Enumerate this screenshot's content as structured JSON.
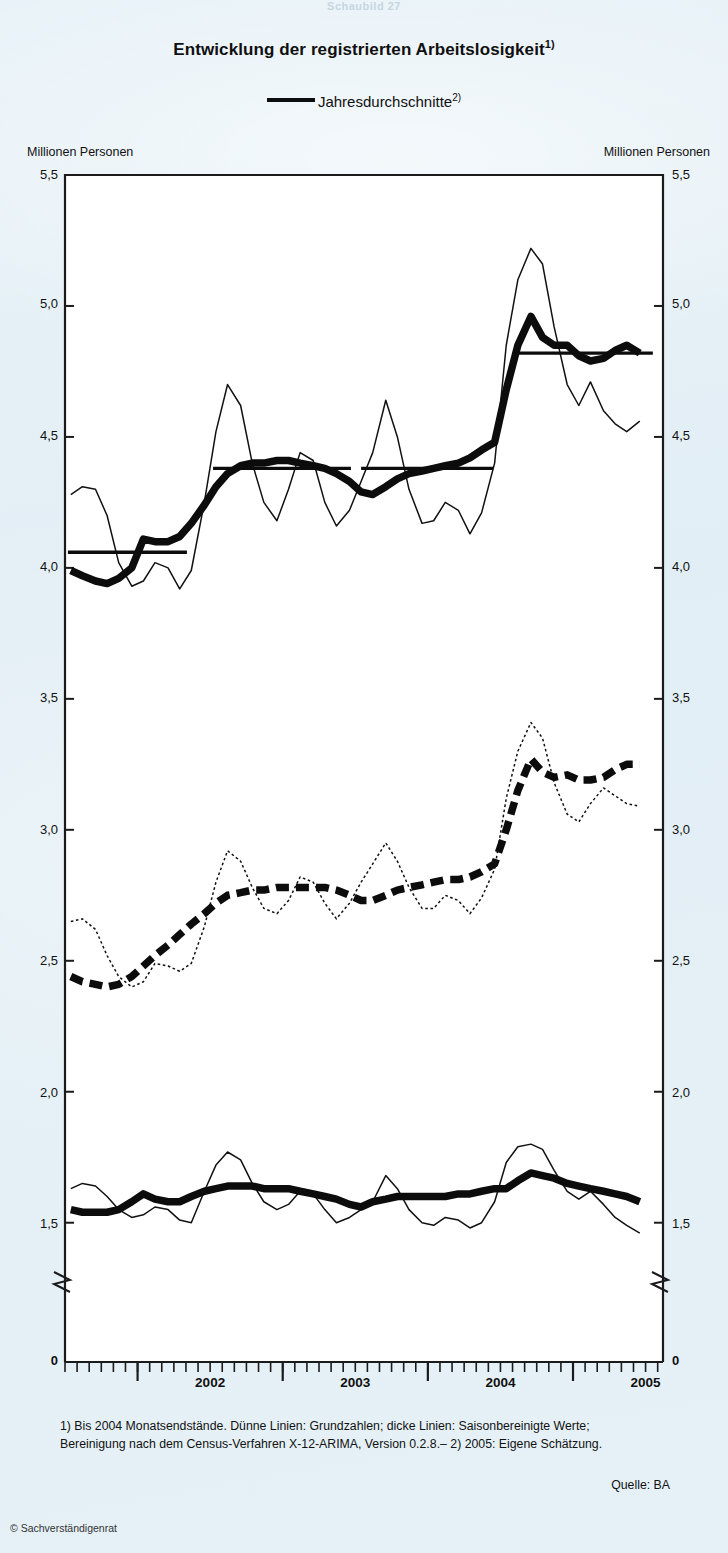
{
  "page": {
    "top_cut_text": "Schaubild 27",
    "copyright": "© Sachverständigenrat",
    "background_hex": "#e6f1f7",
    "ink_hex": "#101010"
  },
  "header": {
    "title": "Entwicklung der registrierten Arbeitslosigkeit",
    "title_footnote_marker": "1)",
    "legend_label": "Jahresdurchschnitte",
    "legend_footnote_marker": "2)"
  },
  "axes": {
    "unit_left": "Millionen Personen",
    "unit_right": "Millionen Personen",
    "y_ticks": [
      "5,5",
      "5,0",
      "4,5",
      "4,0",
      "3,5",
      "3,0",
      "2,5",
      "2,0",
      "1,5",
      "0"
    ],
    "y_zero_label": "0",
    "x_ticks": [
      "2002",
      "2003",
      "2004",
      "2005"
    ],
    "axis_break": true
  },
  "series_labels": {
    "germany": "Deutschland",
    "west": "Früheres Bundesgebiet ohne Berlin",
    "east": "Neue Bundesländer und Berlin"
  },
  "footer": {
    "footnote_line1": "1) Bis 2004 Monatsendstände. Dünne Linien: Grundzahlen; dicke Linien: Saisonbereinigte Werte;",
    "footnote_line2": "Bereinigung nach dem Census-Verfahren X-12-ARIMA, Version 0.2.8.– 2) 2005: Eigene Schätzung.",
    "source": "Quelle: BA"
  },
  "chart_data": {
    "type": "line",
    "title": "Entwicklung der registrierten Arbeitslosigkeit",
    "xlabel": "",
    "ylabel": "Millionen Personen",
    "ylim": [
      1.35,
      5.5
    ],
    "y_axis_break_below": 1.35,
    "xlim": [
      2001.5,
      2005.62
    ],
    "grid": false,
    "legend_position": "top-center",
    "x_tick_values": [
      2002,
      2003,
      2004,
      2005
    ],
    "x_minor_tick_interval_months": 1,
    "series": [
      {
        "name": "Deutschland – Grundzahlen (dünne Linie)",
        "style": "thin-solid",
        "x": [
          2001.54,
          2001.62,
          2001.71,
          2001.79,
          2001.87,
          2001.96,
          2002.04,
          2002.12,
          2002.21,
          2002.29,
          2002.37,
          2002.46,
          2002.54,
          2002.62,
          2002.71,
          2002.79,
          2002.87,
          2002.96,
          2003.04,
          2003.12,
          2003.21,
          2003.29,
          2003.37,
          2003.46,
          2003.54,
          2003.62,
          2003.71,
          2003.79,
          2003.87,
          2003.96,
          2004.04,
          2004.12,
          2004.21,
          2004.29,
          2004.37,
          2004.46,
          2004.54,
          2004.62,
          2004.71,
          2004.79,
          2004.87,
          2004.96,
          2005.04,
          2005.12,
          2005.21,
          2005.29,
          2005.37,
          2005.46
        ],
        "y": [
          4.28,
          4.31,
          4.3,
          4.2,
          4.02,
          3.93,
          3.95,
          4.02,
          4.0,
          3.92,
          3.99,
          4.25,
          4.52,
          4.7,
          4.62,
          4.4,
          4.25,
          4.18,
          4.3,
          4.44,
          4.41,
          4.25,
          4.16,
          4.22,
          4.33,
          4.44,
          4.64,
          4.5,
          4.3,
          4.17,
          4.18,
          4.25,
          4.22,
          4.13,
          4.21,
          4.4,
          4.85,
          5.1,
          5.22,
          5.16,
          4.92,
          4.7,
          4.62,
          4.71,
          4.6,
          4.55,
          4.52,
          4.56
        ]
      },
      {
        "name": "Deutschland – saisonbereinigt (dicke Linie)",
        "style": "thick-solid",
        "x": [
          2001.54,
          2001.62,
          2001.71,
          2001.79,
          2001.87,
          2001.96,
          2002.04,
          2002.12,
          2002.21,
          2002.29,
          2002.37,
          2002.46,
          2002.54,
          2002.62,
          2002.71,
          2002.79,
          2002.87,
          2002.96,
          2003.04,
          2003.12,
          2003.21,
          2003.29,
          2003.37,
          2003.46,
          2003.54,
          2003.62,
          2003.71,
          2003.79,
          2003.87,
          2003.96,
          2004.04,
          2004.12,
          2004.21,
          2004.29,
          2004.37,
          2004.46,
          2004.54,
          2004.62,
          2004.71,
          2004.79,
          2004.87,
          2004.96,
          2005.04,
          2005.12,
          2005.21,
          2005.29,
          2005.37,
          2005.46
        ],
        "y": [
          3.99,
          3.97,
          3.95,
          3.94,
          3.96,
          4.0,
          4.11,
          4.1,
          4.1,
          4.12,
          4.17,
          4.24,
          4.31,
          4.36,
          4.39,
          4.4,
          4.4,
          4.41,
          4.41,
          4.4,
          4.39,
          4.38,
          4.36,
          4.33,
          4.29,
          4.28,
          4.31,
          4.34,
          4.36,
          4.37,
          4.38,
          4.39,
          4.4,
          4.42,
          4.45,
          4.48,
          4.68,
          4.85,
          4.96,
          4.88,
          4.85,
          4.85,
          4.81,
          4.79,
          4.8,
          4.83,
          4.85,
          4.82
        ]
      },
      {
        "name": "Deutschland – Jahresdurchschnitte",
        "style": "annual-average",
        "segments": [
          {
            "x0": 2001.52,
            "x1": 2002.34,
            "y": 4.06
          },
          {
            "x0": 2002.52,
            "x1": 2003.47,
            "y": 4.38
          },
          {
            "x0": 2003.54,
            "x1": 2004.45,
            "y": 4.38
          },
          {
            "x0": 2004.6,
            "x1": 2005.55,
            "y": 4.82
          }
        ]
      },
      {
        "name": "Früheres Bundesgebiet ohne Berlin – Grundzahlen (dünne Linie)",
        "style": "dotted-thin",
        "x": [
          2001.54,
          2001.62,
          2001.71,
          2001.79,
          2001.87,
          2001.96,
          2002.04,
          2002.12,
          2002.21,
          2002.29,
          2002.37,
          2002.46,
          2002.54,
          2002.62,
          2002.71,
          2002.79,
          2002.87,
          2002.96,
          2003.04,
          2003.12,
          2003.21,
          2003.29,
          2003.37,
          2003.46,
          2003.54,
          2003.62,
          2003.71,
          2003.79,
          2003.87,
          2003.96,
          2004.04,
          2004.12,
          2004.21,
          2004.29,
          2004.37,
          2004.46,
          2004.54,
          2004.62,
          2004.71,
          2004.79,
          2004.87,
          2004.96,
          2005.04,
          2005.12,
          2005.21,
          2005.29,
          2005.37,
          2005.46
        ],
        "y": [
          2.65,
          2.66,
          2.62,
          2.52,
          2.44,
          2.4,
          2.42,
          2.49,
          2.48,
          2.46,
          2.49,
          2.63,
          2.8,
          2.92,
          2.88,
          2.78,
          2.7,
          2.68,
          2.73,
          2.82,
          2.8,
          2.72,
          2.66,
          2.72,
          2.8,
          2.87,
          2.95,
          2.88,
          2.78,
          2.7,
          2.7,
          2.75,
          2.73,
          2.68,
          2.74,
          2.85,
          3.12,
          3.3,
          3.41,
          3.35,
          3.18,
          3.06,
          3.03,
          3.1,
          3.16,
          3.13,
          3.1,
          3.09
        ]
      },
      {
        "name": "Früheres Bundesgebiet ohne Berlin – saisonbereinigt (dicke gestrichelte Linie)",
        "style": "thick-dashed",
        "x": [
          2001.54,
          2001.62,
          2001.71,
          2001.79,
          2001.87,
          2001.96,
          2002.04,
          2002.12,
          2002.21,
          2002.29,
          2002.37,
          2002.46,
          2002.54,
          2002.62,
          2002.71,
          2002.79,
          2002.87,
          2002.96,
          2003.04,
          2003.12,
          2003.21,
          2003.29,
          2003.37,
          2003.46,
          2003.54,
          2003.62,
          2003.71,
          2003.79,
          2003.87,
          2003.96,
          2004.04,
          2004.12,
          2004.21,
          2004.29,
          2004.37,
          2004.46,
          2004.54,
          2004.62,
          2004.71,
          2004.79,
          2004.87,
          2004.96,
          2005.04,
          2005.12,
          2005.21,
          2005.29,
          2005.37,
          2005.46
        ],
        "y": [
          2.44,
          2.42,
          2.41,
          2.4,
          2.41,
          2.44,
          2.48,
          2.52,
          2.56,
          2.6,
          2.64,
          2.68,
          2.72,
          2.75,
          2.76,
          2.77,
          2.77,
          2.78,
          2.78,
          2.78,
          2.78,
          2.78,
          2.77,
          2.75,
          2.73,
          2.73,
          2.75,
          2.77,
          2.78,
          2.79,
          2.8,
          2.81,
          2.81,
          2.82,
          2.84,
          2.87,
          3.0,
          3.15,
          3.27,
          3.22,
          3.2,
          3.21,
          3.19,
          3.19,
          3.2,
          3.23,
          3.25,
          3.25
        ]
      },
      {
        "name": "Neue Bundesländer und Berlin – Grundzahlen (dünne Linie)",
        "style": "thin-solid",
        "x": [
          2001.54,
          2001.62,
          2001.71,
          2001.79,
          2001.87,
          2001.96,
          2002.04,
          2002.12,
          2002.21,
          2002.29,
          2002.37,
          2002.46,
          2002.54,
          2002.62,
          2002.71,
          2002.79,
          2002.87,
          2002.96,
          2003.04,
          2003.12,
          2003.21,
          2003.29,
          2003.37,
          2003.46,
          2003.54,
          2003.62,
          2003.71,
          2003.79,
          2003.87,
          2003.96,
          2004.04,
          2004.12,
          2004.21,
          2004.29,
          2004.37,
          2004.46,
          2004.54,
          2004.62,
          2004.71,
          2004.79,
          2004.87,
          2004.96,
          2005.04,
          2005.12,
          2005.21,
          2005.29,
          2005.37,
          2005.46
        ],
        "y": [
          1.63,
          1.65,
          1.64,
          1.6,
          1.55,
          1.52,
          1.53,
          1.56,
          1.55,
          1.51,
          1.5,
          1.62,
          1.72,
          1.77,
          1.74,
          1.65,
          1.58,
          1.55,
          1.57,
          1.62,
          1.61,
          1.55,
          1.5,
          1.52,
          1.55,
          1.58,
          1.68,
          1.63,
          1.55,
          1.5,
          1.49,
          1.52,
          1.51,
          1.48,
          1.5,
          1.58,
          1.73,
          1.79,
          1.8,
          1.78,
          1.7,
          1.62,
          1.59,
          1.62,
          1.57,
          1.52,
          1.49,
          1.46
        ]
      },
      {
        "name": "Neue Bundesländer und Berlin – saisonbereinigt (dicke Linie)",
        "style": "thick-solid",
        "x": [
          2001.54,
          2001.62,
          2001.71,
          2001.79,
          2001.87,
          2001.96,
          2002.04,
          2002.12,
          2002.21,
          2002.29,
          2002.37,
          2002.46,
          2002.54,
          2002.62,
          2002.71,
          2002.79,
          2002.87,
          2002.96,
          2003.04,
          2003.12,
          2003.21,
          2003.29,
          2003.37,
          2003.46,
          2003.54,
          2003.62,
          2003.71,
          2003.79,
          2003.87,
          2003.96,
          2004.04,
          2004.12,
          2004.21,
          2004.29,
          2004.37,
          2004.46,
          2004.54,
          2004.62,
          2004.71,
          2004.79,
          2004.87,
          2004.96,
          2005.04,
          2005.12,
          2005.21,
          2005.29,
          2005.37,
          2005.46
        ],
        "y": [
          1.55,
          1.54,
          1.54,
          1.54,
          1.55,
          1.58,
          1.61,
          1.59,
          1.58,
          1.58,
          1.6,
          1.62,
          1.63,
          1.64,
          1.64,
          1.64,
          1.63,
          1.63,
          1.63,
          1.62,
          1.61,
          1.6,
          1.59,
          1.57,
          1.56,
          1.58,
          1.59,
          1.6,
          1.6,
          1.6,
          1.6,
          1.6,
          1.61,
          1.61,
          1.62,
          1.63,
          1.63,
          1.66,
          1.69,
          1.68,
          1.67,
          1.65,
          1.64,
          1.63,
          1.62,
          1.61,
          1.6,
          1.58
        ]
      }
    ]
  }
}
